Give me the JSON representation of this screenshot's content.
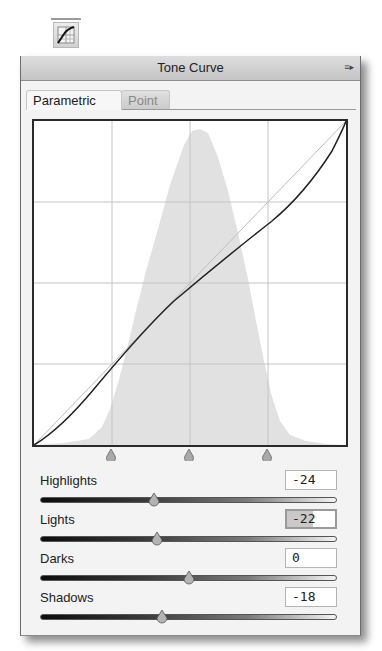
{
  "toolbar": {
    "tool_icon": "tone-curve-icon"
  },
  "panel": {
    "title": "Tone Curve",
    "menu_icon": "≡▸"
  },
  "tabs": [
    {
      "label": "Parametric",
      "active": true
    },
    {
      "label": "Point",
      "active": false
    }
  ],
  "graph": {
    "grid_divisions": 4,
    "split_points": [
      25,
      50,
      75
    ],
    "colors": {
      "histogram": "#e1e1e1",
      "grid": "#c4c4c4",
      "curve": "#222222",
      "baseline": "#bdbdbd"
    }
  },
  "sliders": [
    {
      "label": "Highlights",
      "value": "-24",
      "position": 0.38,
      "focused": false
    },
    {
      "label": "Lights",
      "value": "-22",
      "position": 0.39,
      "focused": true
    },
    {
      "label": "Darks",
      "value": "0",
      "position": 0.5,
      "focused": false
    },
    {
      "label": "Shadows",
      "value": "-18",
      "position": 0.41,
      "focused": false
    }
  ]
}
